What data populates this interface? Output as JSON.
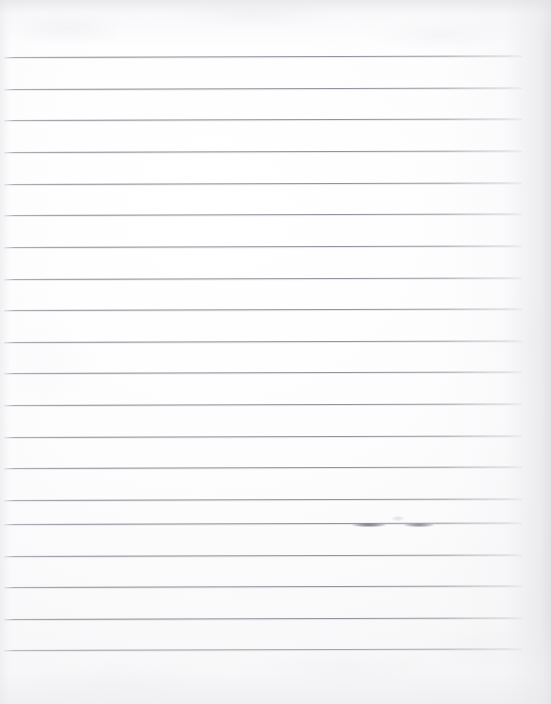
{
  "document": {
    "type": "scanned-ruled-notebook-paper",
    "title": "Blank lined paper scan",
    "orientation": "portrait",
    "width_px": 551,
    "height_px": 704,
    "written_text": "",
    "has_handwriting": false,
    "paper_color": "#fdfdfd",
    "background_color": "#ffffff",
    "rule_color": "#86868f",
    "shadow_edge_color": "#dddde2"
  },
  "ruling": {
    "line_count": 20,
    "first_line_y": 57,
    "line_spacing_px": 31.7,
    "line_start_x": 4,
    "line_end_x": 522,
    "line_thickness_px": 1,
    "tilt_deg": -0.18,
    "margin_rule": "none",
    "header_space_px": 57,
    "footer_space_px": 55,
    "lines": [
      {
        "index": 1,
        "y": 57,
        "x1": 4,
        "x2": 522
      },
      {
        "index": 2,
        "y": 89,
        "x1": 4,
        "x2": 522
      },
      {
        "index": 3,
        "y": 120,
        "x1": 4,
        "x2": 522
      },
      {
        "index": 4,
        "y": 152,
        "x1": 4,
        "x2": 522
      },
      {
        "index": 5,
        "y": 184,
        "x1": 4,
        "x2": 522
      },
      {
        "index": 6,
        "y": 215,
        "x1": 4,
        "x2": 522
      },
      {
        "index": 7,
        "y": 247,
        "x1": 4,
        "x2": 522
      },
      {
        "index": 8,
        "y": 279,
        "x1": 4,
        "x2": 522
      },
      {
        "index": 9,
        "y": 310,
        "x1": 4,
        "x2": 522
      },
      {
        "index": 10,
        "y": 342,
        "x1": 4,
        "x2": 522
      },
      {
        "index": 11,
        "y": 373,
        "x1": 4,
        "x2": 522
      },
      {
        "index": 12,
        "y": 405,
        "x1": 4,
        "x2": 522
      },
      {
        "index": 13,
        "y": 437,
        "x1": 4,
        "x2": 522
      },
      {
        "index": 14,
        "y": 468,
        "x1": 4,
        "x2": 522
      },
      {
        "index": 15,
        "y": 500,
        "x1": 4,
        "x2": 522
      },
      {
        "index": 16,
        "y": 524,
        "x1": 4,
        "x2": 522
      },
      {
        "index": 17,
        "y": 556,
        "x1": 4,
        "x2": 522
      },
      {
        "index": 18,
        "y": 587,
        "x1": 4,
        "x2": 522
      },
      {
        "index": 19,
        "y": 619,
        "x1": 4,
        "x2": 522
      },
      {
        "index": 20,
        "y": 650,
        "x1": 4,
        "x2": 522
      }
    ]
  },
  "marks": [
    {
      "id": "smudge-left",
      "on_line": 16,
      "x": 352,
      "y": 523,
      "width": 34,
      "height": 4,
      "shade": "#56565f"
    },
    {
      "id": "smudge-right",
      "on_line": 16,
      "x": 404,
      "y": 523,
      "width": 30,
      "height": 4,
      "shade": "#5c5c66"
    },
    {
      "id": "speck-above",
      "on_line": 16,
      "x": 392,
      "y": 516,
      "width": 12,
      "height": 5,
      "shade": "#afafb9"
    }
  ]
}
